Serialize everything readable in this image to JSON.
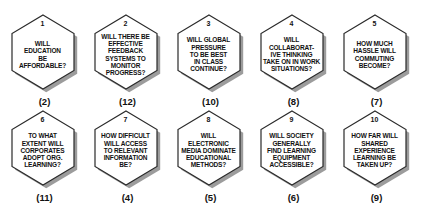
{
  "diagram": {
    "colors": {
      "background": "#ffffff",
      "hexagon_fill": "#ffffff",
      "hexagon_outline": "#2a2a2a",
      "hexagon_shadow": "#9c9c9c",
      "text": "#111111"
    }
  },
  "hexagons": [
    {
      "number": "1",
      "question": "WILL\nEDUCATION\nBE\nAFFORDABLE?",
      "count": "(2)"
    },
    {
      "number": "2",
      "question": "WILL THERE BE\nEFFECTIVE\nFEEDBACK\nSYSTEMS TO\nMONITOR\nPROGRESS?",
      "count": "(12)"
    },
    {
      "number": "3",
      "question": "WILL GLOBAL\nPRESSURE\nTO BE BEST\nIN CLASS\nCONTINUE?",
      "count": "(10)"
    },
    {
      "number": "4",
      "question": "WILL\nCOLLABORAT-\nIVE THINKING\nTAKE ON IN WORK\nSITUATIONS?",
      "count": "(8)"
    },
    {
      "number": "5",
      "question": "HOW MUCH\nHASSLE WILL\nCOMMUTING\nBECOME?",
      "count": "(7)"
    },
    {
      "number": "6",
      "question": "TO WHAT\nEXTENT WILL\nCORPORATES\nADOPT ORG.\nLEARNING?",
      "count": "(11)"
    },
    {
      "number": "7",
      "question": "HOW DIFFICULT\nWILL ACCESS\nTO RELEVANT\nINFORMATION\nBE?",
      "count": "(4)"
    },
    {
      "number": "8",
      "question": "WILL\nELECTRONIC\nMEDIA DOMINATE\nEDUCATIONAL\nMETHODS?",
      "count": "(5)"
    },
    {
      "number": "9",
      "question": "WILL SOCIETY\nGENERALLY\nFIND LEARNING\nEQUIPMENT\nACCESSIBLE?",
      "count": "(6)"
    },
    {
      "number": "10",
      "question": "HOW FAR WILL\nSHARED\nEXPERIENCE\nLEARNING BE\nTAKEN UP?",
      "count": "(9)"
    }
  ]
}
